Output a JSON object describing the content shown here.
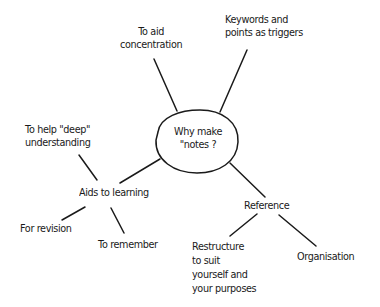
{
  "diagram": {
    "type": "mind-map",
    "style": "hand-drawn",
    "colors": {
      "ink": "#1a1a1a",
      "background": "#ffffff"
    },
    "center": {
      "label": "Why make\n\"notes ?"
    },
    "branches": [
      {
        "id": "concentration",
        "label": "To aid\nconcentration",
        "children": []
      },
      {
        "id": "keywords",
        "label": "Keywords and\npoints as triggers",
        "children": []
      },
      {
        "id": "aids-to-learning",
        "label": "Aids to learning",
        "children": [
          {
            "id": "deep-understanding",
            "label": "To help \"deep\"\nunderstanding"
          },
          {
            "id": "revision",
            "label": "For revision"
          },
          {
            "id": "remember",
            "label": "To remember"
          }
        ]
      },
      {
        "id": "reference",
        "label": "Reference",
        "children": [
          {
            "id": "restructure",
            "label": "Restructure\nto suit\nyourself and\nyour purposes"
          },
          {
            "id": "organisation",
            "label": "Organisation"
          }
        ]
      }
    ]
  }
}
